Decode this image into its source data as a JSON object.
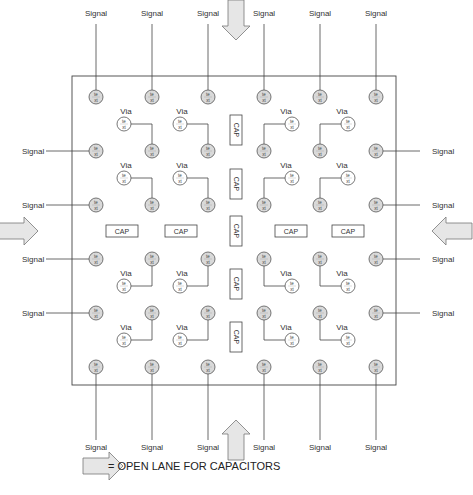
{
  "diagram": {
    "frame": {
      "x1": 72,
      "y1": 76,
      "x2": 396,
      "y2": 385
    },
    "labels": {
      "signal": "Signal",
      "via": "Via",
      "cap": "CAP",
      "pin_top": "te",
      "pin_bottom": "xt"
    },
    "legend": {
      "text": "= OPEN LANE FOR CAPACITORS",
      "icon": "open-lane-arrow-icon"
    },
    "colors": {
      "line": "#444444",
      "pin_fill": "#d9d9d9",
      "via_fill": "#ffffff",
      "arrow_fill": "#e6e6e6",
      "arrow_stroke": "#777777"
    },
    "columns": [
      96,
      152,
      208,
      264,
      320,
      376
    ],
    "rows": [
      97,
      151,
      205,
      259,
      313,
      367
    ],
    "top_signals": [
      96,
      152,
      208,
      264,
      320,
      376
    ],
    "bottom_signals": [
      96,
      152,
      208,
      264,
      320,
      376
    ],
    "left_signals": [
      151,
      205,
      259,
      313
    ],
    "right_signals": [
      151,
      205,
      259,
      313
    ],
    "vias": [
      {
        "x": 124,
        "y": 124,
        "pin_x": 152,
        "pin_y": 151
      },
      {
        "x": 180,
        "y": 124,
        "pin_x": 208,
        "pin_y": 151
      },
      {
        "x": 292,
        "y": 124,
        "pin_x": 264,
        "pin_y": 151
      },
      {
        "x": 348,
        "y": 124,
        "pin_x": 320,
        "pin_y": 151
      },
      {
        "x": 124,
        "y": 178,
        "pin_x": 152,
        "pin_y": 205
      },
      {
        "x": 180,
        "y": 178,
        "pin_x": 208,
        "pin_y": 205
      },
      {
        "x": 292,
        "y": 178,
        "pin_x": 264,
        "pin_y": 205
      },
      {
        "x": 348,
        "y": 178,
        "pin_x": 320,
        "pin_y": 205
      },
      {
        "x": 124,
        "y": 286,
        "pin_x": 152,
        "pin_y": 259
      },
      {
        "x": 180,
        "y": 286,
        "pin_x": 208,
        "pin_y": 259
      },
      {
        "x": 292,
        "y": 286,
        "pin_x": 264,
        "pin_y": 259
      },
      {
        "x": 348,
        "y": 286,
        "pin_x": 320,
        "pin_y": 259
      },
      {
        "x": 124,
        "y": 340,
        "pin_x": 152,
        "pin_y": 313
      },
      {
        "x": 180,
        "y": 340,
        "pin_x": 208,
        "pin_y": 313
      },
      {
        "x": 292,
        "y": 340,
        "pin_x": 264,
        "pin_y": 313
      },
      {
        "x": 348,
        "y": 340,
        "pin_x": 320,
        "pin_y": 313
      }
    ],
    "caps_horizontal": [
      {
        "x": 122,
        "y": 231
      },
      {
        "x": 181,
        "y": 231
      },
      {
        "x": 291,
        "y": 231
      },
      {
        "x": 348,
        "y": 231
      }
    ],
    "caps_vertical": [
      {
        "x": 236,
        "y": 130
      },
      {
        "x": 236,
        "y": 184
      },
      {
        "x": 236,
        "y": 231
      },
      {
        "x": 236,
        "y": 284
      },
      {
        "x": 236,
        "y": 337
      }
    ],
    "arrows": [
      {
        "dir": "down",
        "x": 236,
        "y": 20
      },
      {
        "dir": "up",
        "x": 236,
        "y": 440
      },
      {
        "dir": "right",
        "x": 18,
        "y": 231
      },
      {
        "dir": "left",
        "x": 452,
        "y": 231
      }
    ]
  }
}
